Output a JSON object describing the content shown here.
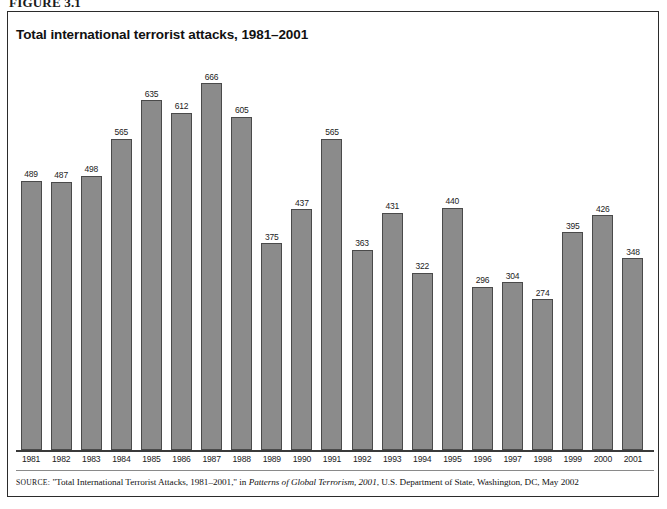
{
  "figure": {
    "label": "FIGURE 3.1"
  },
  "chart_title": "Total international terrorist attacks, 1981–2001",
  "source": {
    "prefix": "SOURCE:",
    "quoted_title": "\"Total International Terrorist Attacks, 1981–2001,\"",
    "connector": "in",
    "publication": "Patterns of Global Terrorism, 2001",
    "publisher": ", U.S. Department of State, Washington, DC, May 2002"
  },
  "colors": {
    "bar_fill": "#8b8b8b",
    "bar_border": "#4a4a4a",
    "frame": "#2b2b2b",
    "axis": "#3a3a3a",
    "text": "#111111",
    "background": "#ffffff"
  },
  "chart_data": {
    "type": "bar",
    "title": "Total international terrorist attacks, 1981–2001",
    "xlabel": "",
    "ylabel": "",
    "ylim": [
      0,
      700
    ],
    "grid": false,
    "legend": "none",
    "axis_visible": "x-only",
    "data_labels": true,
    "categories": [
      "1981",
      "1982",
      "1983",
      "1984",
      "1985",
      "1986",
      "1987",
      "1988",
      "1989",
      "1990",
      "1991",
      "1992",
      "1993",
      "1994",
      "1995",
      "1996",
      "1997",
      "1998",
      "1999",
      "2000",
      "2001"
    ],
    "values": [
      489,
      487,
      498,
      565,
      635,
      612,
      666,
      605,
      375,
      437,
      565,
      363,
      431,
      322,
      440,
      296,
      304,
      274,
      395,
      426,
      348
    ]
  }
}
